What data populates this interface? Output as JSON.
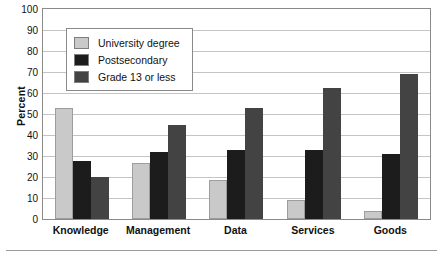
{
  "chart_data": {
    "type": "bar",
    "title": "",
    "xlabel": "",
    "ylabel": "Percent",
    "ylim": [
      0,
      100
    ],
    "ytick_step": 10,
    "yticks": [
      0,
      10,
      20,
      30,
      40,
      50,
      60,
      70,
      80,
      90,
      100
    ],
    "grid": true,
    "legend_position": "top-left-inside",
    "categories": [
      "Knowledge",
      "Management",
      "Data",
      "Services",
      "Goods"
    ],
    "series": [
      {
        "name": "University degree",
        "color": "#c9c9c9",
        "values": [
          53,
          26.5,
          18.5,
          9,
          4
        ]
      },
      {
        "name": "Postsecondary",
        "color": "#1c1c1c",
        "values": [
          27.5,
          32,
          33,
          33,
          31
        ]
      },
      {
        "name": "Grade 13 or less",
        "color": "#434343",
        "values": [
          20,
          45,
          53,
          62.5,
          69
        ]
      }
    ]
  },
  "legend": {
    "items": [
      {
        "label": "University degree",
        "color": "#c9c9c9"
      },
      {
        "label": "Postsecondary",
        "color": "#1c1c1c"
      },
      {
        "label": "Grade 13 or less",
        "color": "#434343"
      }
    ]
  },
  "colors": {
    "frame": "#8a8a8a",
    "gridline": "#c4c4c4",
    "text": "#111111",
    "background": "#ffffff"
  }
}
